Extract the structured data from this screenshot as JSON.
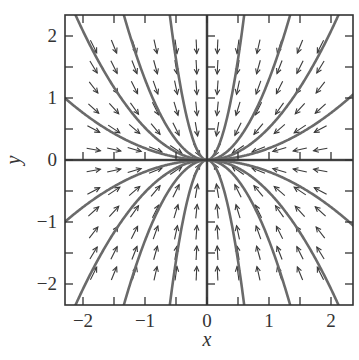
{
  "chart_data": {
    "type": "phase-portrait",
    "title": "",
    "xlabel": "x",
    "ylabel": "y",
    "xlim": [
      -2.3,
      2.35
    ],
    "ylim": [
      -2.35,
      2.35
    ],
    "x_ticks": [
      -2,
      -1,
      0,
      1,
      2
    ],
    "y_ticks": [
      -2,
      -1,
      0,
      1,
      2
    ],
    "x_tick_labels": [
      "−2",
      "−1",
      "0",
      "1",
      "2"
    ],
    "y_tick_labels": [
      "−2",
      "−1",
      "0",
      "1",
      "2"
    ],
    "minor_tick_step": 0.5,
    "grid": false,
    "system": {
      "dx": "-x",
      "dy": "-2y",
      "description": "stable node at origin"
    },
    "vector_field": {
      "x_positions": [
        -1.83,
        -1.5,
        -1.17,
        -0.83,
        -0.5,
        -0.17,
        0.17,
        0.5,
        0.83,
        1.17,
        1.5,
        1.83
      ],
      "y_positions": [
        -1.83,
        -1.5,
        -1.17,
        -0.83,
        -0.5,
        -0.17,
        0.17,
        0.5,
        0.83,
        1.17,
        1.5,
        1.83
      ],
      "arrow_length_px": 14
    },
    "trajectories": {
      "form": "y = c * x^2",
      "c_values": [
        0.19,
        0.52,
        1.3,
        6.5,
        -0.19,
        -0.52,
        -1.3,
        -6.5
      ],
      "also": [
        "x-axis (y = 0)",
        "y-axis (x = 0)"
      ]
    },
    "colors": {
      "frame": "#333333",
      "trajectory": "#6a6a6a",
      "arrow": "#3a3a3a"
    }
  }
}
